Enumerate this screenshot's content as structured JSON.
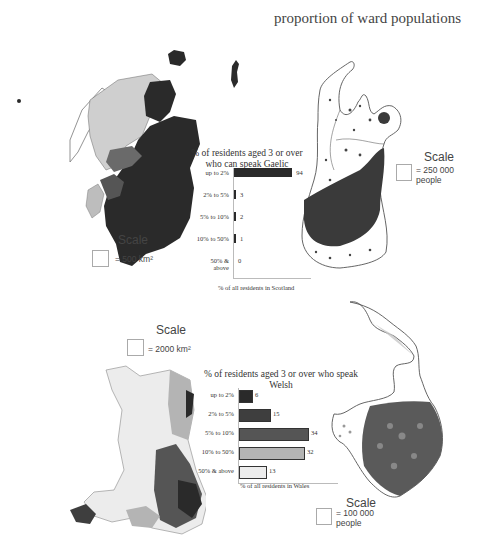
{
  "header": {
    "title": "proportion of ward populations"
  },
  "scotland": {
    "chart_title_line1": "% of residents aged 3 or over",
    "chart_title_line2": "who can speak Gaelic",
    "xlabel": "% of all residents in Scotland",
    "map_scale": {
      "label": "Scale",
      "value": "= 500 km²"
    },
    "cartogram_scale": {
      "label": "Scale",
      "value_line1": "= 250 000",
      "value_line2": "people"
    }
  },
  "wales": {
    "chart_title": "% of residents aged 3 or over who speak Welsh",
    "xlabel": "% of all residents in Wales",
    "map_scale": {
      "label": "Scale",
      "value": "= 2000 km²"
    },
    "cartogram_scale": {
      "label": "Scale",
      "value_line1": "= 100 000",
      "value_line2": "people"
    }
  },
  "colors": {
    "band1": "#2a2a2a",
    "band2": "#3e3e3e",
    "band3": "#555555",
    "band4": "#b4b4b4",
    "band5": "#ececec"
  },
  "chart_data": [
    {
      "type": "bar",
      "orientation": "horizontal",
      "title": "% of residents aged 3 or over who can speak Gaelic",
      "categories": [
        "up to 2%",
        "2% to 5%",
        "5% to 10%",
        "10% to 50%",
        "50% & above"
      ],
      "values": [
        94,
        3,
        2,
        1,
        0
      ],
      "xlabel": "% of all residents in Scotland",
      "ylabel": "",
      "xlim": [
        0,
        100
      ]
    },
    {
      "type": "bar",
      "orientation": "horizontal",
      "title": "% of residents aged 3 or over who speak Welsh",
      "categories": [
        "up to 2%",
        "2% to 5%",
        "5% to 10%",
        "10% to 50%",
        "50% & above"
      ],
      "values": [
        6,
        15,
        34,
        32,
        13
      ],
      "xlabel": "% of all residents in Wales",
      "ylabel": "",
      "xlim": [
        0,
        40
      ]
    }
  ]
}
